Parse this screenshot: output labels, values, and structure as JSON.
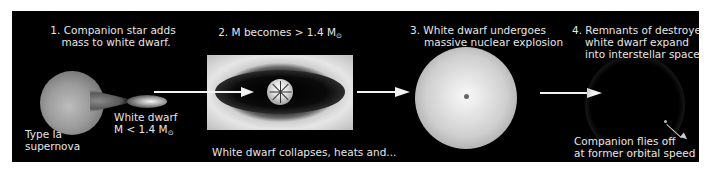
{
  "title": "Type Ia supernova",
  "stages": [
    {
      "step": "1",
      "caption_line1": "1. Companion star adds",
      "caption_line2": "mass to white dwarf.",
      "label_wd_line1": "White dwarf",
      "label_wd_mass": "M < 1.4 M",
      "label_type_line1": "Type Ia",
      "label_type_line2": "supernova"
    },
    {
      "step": "2",
      "caption": "2. M becomes > 1.4 M",
      "bottom_caption": "White dwarf collapses, heats and..."
    },
    {
      "step": "3",
      "caption_line1": "3. White dwarf undergoes",
      "caption_line2": "massive nuclear explosion"
    },
    {
      "step": "4",
      "caption_line1": "4. Remnants of destroyed",
      "caption_line2": "white dwarf expand",
      "caption_line3": "into interstellar space",
      "companion_line1": "Companion flies off",
      "companion_line2": "at former orbital speed"
    }
  ],
  "symbols": {
    "sun": "⊙"
  },
  "colors": {
    "background": "#000000",
    "text": "#e6e6e6",
    "frame": "#ffffff"
  }
}
